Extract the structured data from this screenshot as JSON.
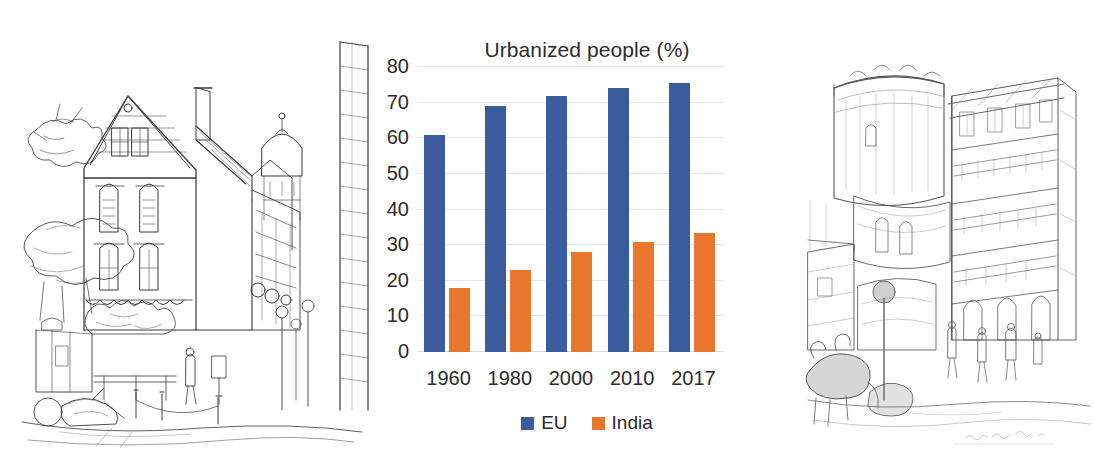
{
  "layout": {
    "left_illustration": {
      "name": "european-street-sketch",
      "description": "Pen-and-ink line drawing of a European street corner with a tall gabled townhouse, dormer windows, chimney, a domed tower behind, leafy trees, street lamps, bollards, a parked bicycle and a standing figure."
    },
    "right_illustration": {
      "name": "indian-street-sketch",
      "description": "Pencil drawing of a dense Indian street scene with a round fort-like tower, multi-storey balconied buildings, pedestrians, a cow in the foreground and a faint handwritten signature at the lower right."
    },
    "signature_text": "Vanasai 85  Feb  95"
  },
  "chart_data": {
    "type": "bar",
    "title": "Urbanized people (%)",
    "xlabel": "",
    "ylabel": "",
    "categories": [
      "1960",
      "1980",
      "2000",
      "2010",
      "2017"
    ],
    "series": [
      {
        "name": "EU",
        "color": "#3a5c9e",
        "values": [
          61,
          69,
          72,
          74,
          75.5
        ]
      },
      {
        "name": "India",
        "color": "#e8762c",
        "values": [
          18,
          23,
          28,
          31,
          33.5
        ]
      }
    ],
    "ylim": [
      0,
      80
    ],
    "yticks": [
      80,
      70,
      60,
      50,
      40,
      30,
      20,
      10,
      0
    ],
    "grid": true,
    "legend_position": "bottom"
  },
  "colors": {
    "eu": "#3a5c9e",
    "india": "#e8762c",
    "grid": "#e4e6ea",
    "text": "#2b2b2b",
    "background": "#ffffff"
  }
}
